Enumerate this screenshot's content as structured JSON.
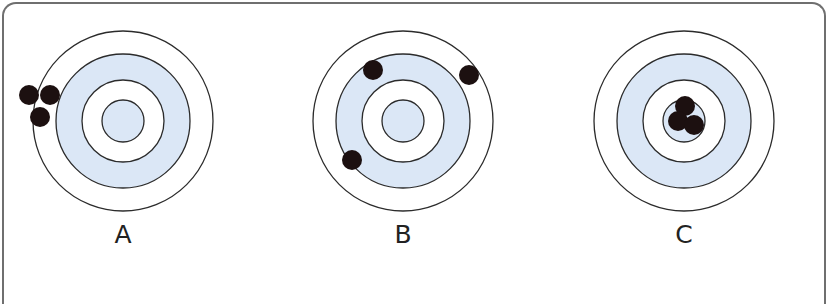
{
  "colors": {
    "ring_fill": "#dbe7f6",
    "ring_stroke": "#2b2b2b",
    "shot": "#1c1010",
    "border": "#6f6f6f"
  },
  "targets": [
    {
      "label": "A",
      "center": [
        123,
        121
      ],
      "radii": [
        90,
        67,
        41,
        21
      ],
      "shots": [
        [
          29,
          95
        ],
        [
          50,
          95
        ],
        [
          40,
          117
        ]
      ]
    },
    {
      "label": "B",
      "center": [
        403,
        121
      ],
      "radii": [
        90,
        67,
        41,
        21
      ],
      "shots": [
        [
          373,
          70
        ],
        [
          469,
          75
        ],
        [
          352,
          160
        ]
      ]
    },
    {
      "label": "C",
      "center": [
        684,
        121
      ],
      "radii": [
        90,
        67,
        41,
        21
      ],
      "shots": [
        [
          685,
          106
        ],
        [
          678,
          121
        ],
        [
          694,
          125
        ]
      ]
    }
  ]
}
